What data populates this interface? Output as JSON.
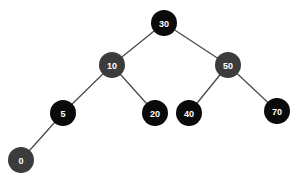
{
  "diagram": {
    "type": "binary-tree",
    "colors": {
      "black_node": "#0a0a0a",
      "gray_node": "#3c3c3c",
      "edge": "#4a4a4a",
      "label": "#ffffff",
      "background": "#ffffff"
    },
    "nodes": [
      {
        "id": "n30",
        "label": "30",
        "x": 164,
        "y": 23,
        "color": "black"
      },
      {
        "id": "n10",
        "label": "10",
        "x": 112,
        "y": 65,
        "color": "gray"
      },
      {
        "id": "n50",
        "label": "50",
        "x": 228,
        "y": 65,
        "color": "gray"
      },
      {
        "id": "n5",
        "label": "5",
        "x": 63,
        "y": 113,
        "color": "black"
      },
      {
        "id": "n20",
        "label": "20",
        "x": 155,
        "y": 113,
        "color": "black"
      },
      {
        "id": "n40",
        "label": "40",
        "x": 189,
        "y": 113,
        "color": "black"
      },
      {
        "id": "n70",
        "label": "70",
        "x": 277,
        "y": 111,
        "color": "black"
      },
      {
        "id": "n0",
        "label": "0",
        "x": 21,
        "y": 160,
        "color": "gray"
      }
    ],
    "edges": [
      {
        "from": "n30",
        "to": "n10"
      },
      {
        "from": "n30",
        "to": "n50"
      },
      {
        "from": "n10",
        "to": "n5"
      },
      {
        "from": "n10",
        "to": "n20"
      },
      {
        "from": "n50",
        "to": "n40"
      },
      {
        "from": "n50",
        "to": "n70"
      },
      {
        "from": "n5",
        "to": "n0"
      }
    ],
    "node_radius": 13
  }
}
